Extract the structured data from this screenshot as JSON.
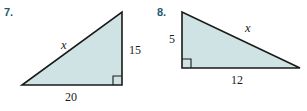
{
  "page": {
    "background_color": "#ffffff",
    "width": 307,
    "height": 111
  },
  "style": {
    "triangle_fill": "#cfe3e4",
    "triangle_stroke": "#1a1a1a",
    "number_color": "#1c5a6e",
    "label_color": "#1a1a1a"
  },
  "problems": [
    {
      "number": "7.",
      "figure": {
        "shape": "right-triangle",
        "right_angle_position": "bottom-right",
        "labels": {
          "hypotenuse": "x",
          "vertical_leg": "15",
          "horizontal_leg": "20"
        }
      }
    },
    {
      "number": "8.",
      "figure": {
        "shape": "right-triangle",
        "right_angle_position": "bottom-left",
        "labels": {
          "hypotenuse": "x",
          "vertical_leg": "5",
          "horizontal_leg": "12"
        }
      }
    }
  ]
}
